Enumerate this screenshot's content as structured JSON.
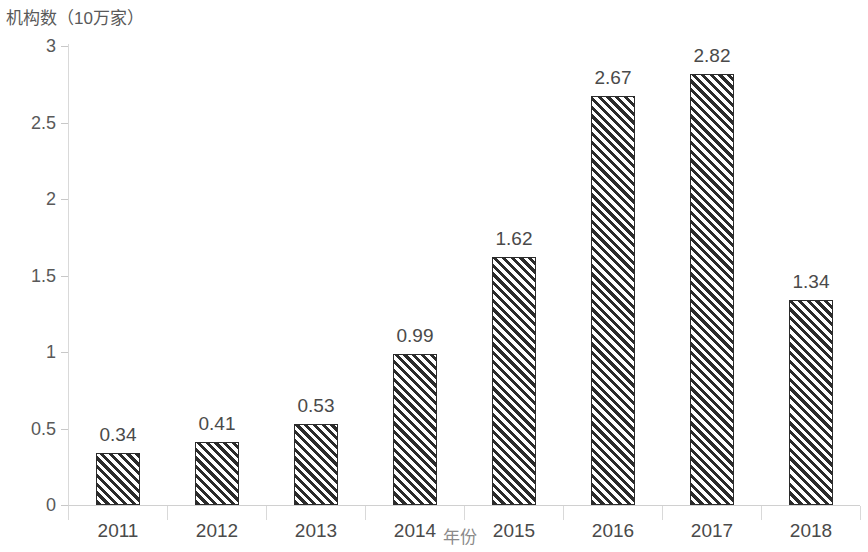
{
  "chart_data": {
    "type": "bar",
    "title": "",
    "ylabel": "机构数（10万家）",
    "xlabel": "年份",
    "categories": [
      "2011",
      "2012",
      "2013",
      "2014",
      "2015",
      "2016",
      "2017",
      "2018"
    ],
    "values": [
      0.34,
      0.41,
      0.53,
      0.99,
      1.62,
      2.67,
      2.82,
      1.34
    ],
    "data_labels": [
      "0.34",
      "0.41",
      "0.53",
      "0.99",
      "1.62",
      "2.67",
      "2.82",
      "1.34"
    ],
    "ylim": [
      0,
      3
    ],
    "ytick_labels": [
      "0",
      "0.5",
      "1",
      "1.5",
      "2",
      "2.5",
      "3"
    ],
    "ytick_values": [
      0,
      0.5,
      1,
      1.5,
      2,
      2.5,
      3
    ],
    "grid": false,
    "legend": null,
    "legend_position": "none",
    "series": [
      {
        "name": "机构数",
        "values": [
          0.34,
          0.41,
          0.53,
          0.99,
          1.62,
          2.67,
          2.82,
          1.34
        ]
      }
    ],
    "colors": {
      "bar_fill": "#ffffff",
      "bar_hatch": "#2b2b2b",
      "bar_border": "#2b2b2b",
      "axis_line": "#d9d9d9",
      "tick_text": "#4a4a4a",
      "axis_title_text": "#595959"
    },
    "bar_style": "diagonal-hatch"
  }
}
